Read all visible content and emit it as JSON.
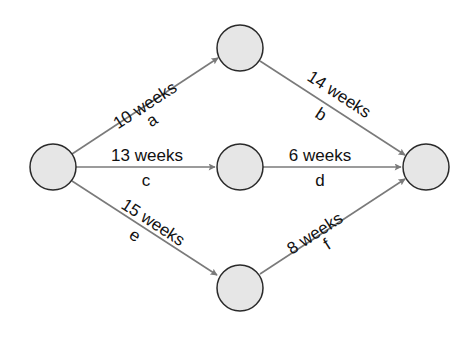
{
  "diagram": {
    "type": "activity-network",
    "nodes": [
      {
        "id": "start",
        "x": 53,
        "y": 167
      },
      {
        "id": "top",
        "x": 240,
        "y": 48
      },
      {
        "id": "middle",
        "x": 240,
        "y": 167
      },
      {
        "id": "bottom",
        "x": 240,
        "y": 288
      },
      {
        "id": "end",
        "x": 426,
        "y": 167
      }
    ],
    "edges": [
      {
        "id": "a",
        "from": "start",
        "to": "top",
        "duration": "10 weeks",
        "letter": "a"
      },
      {
        "id": "b",
        "from": "top",
        "to": "end",
        "duration": "14 weeks",
        "letter": "b"
      },
      {
        "id": "c",
        "from": "start",
        "to": "middle",
        "duration": "13 weeks",
        "letter": "c"
      },
      {
        "id": "d",
        "from": "middle",
        "to": "end",
        "duration": "6 weeks",
        "letter": "d"
      },
      {
        "id": "e",
        "from": "start",
        "to": "bottom",
        "duration": "15 weeks",
        "letter": "e"
      },
      {
        "id": "f",
        "from": "bottom",
        "to": "end",
        "duration": "8 weeks",
        "letter": "f"
      }
    ],
    "colors": {
      "node_fill": "#e6e6e6",
      "node_stroke": "#2a2a2a",
      "edge": "#7a7a7a",
      "text": "#111111"
    }
  }
}
